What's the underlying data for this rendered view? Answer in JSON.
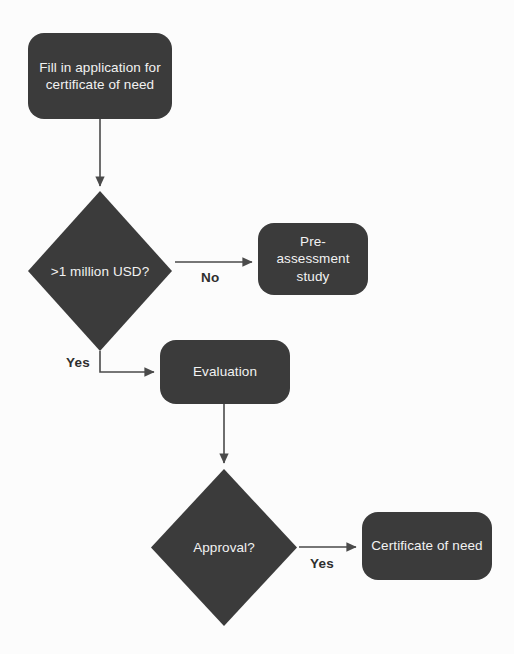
{
  "diagram": {
    "background_color": "#fcfcfc",
    "node_fill_color": "#3b3b3b",
    "node_text_color": "#f2f2f2",
    "connector_color": "#4a4a4a",
    "label_text_color": "#2e2e2e",
    "nodes": [
      {
        "id": "fill-application",
        "shape": "rounded-rectangle",
        "line1": "Fill in application for",
        "line2": "certificate of need"
      },
      {
        "id": "million-usd-decision",
        "shape": "diamond",
        "label": ">1 million USD?"
      },
      {
        "id": "pre-assessment-study",
        "shape": "rounded-rectangle",
        "line1": "Pre-assessment",
        "line2": "study"
      },
      {
        "id": "evaluation",
        "shape": "rounded-rectangle",
        "line1": "Evaluation"
      },
      {
        "id": "approval-decision",
        "shape": "diamond",
        "label": "Approval?"
      },
      {
        "id": "certificate-of-need",
        "shape": "rounded-rectangle",
        "line1": "Certificate of need"
      }
    ],
    "edge_labels": {
      "no_branch": "No",
      "yes_branch": "Yes",
      "approval_yes_branch": "Yes"
    }
  }
}
